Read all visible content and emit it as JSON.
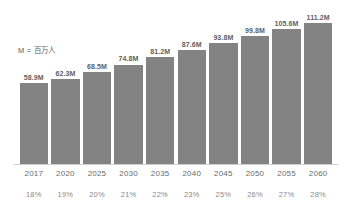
{
  "chart_data": {
    "type": "bar",
    "title": "",
    "subtitle": "",
    "xlabel": "",
    "ylabel": "",
    "grid": false,
    "legend_position": "inside-top-left",
    "annotations": [
      "M = 百万人"
    ],
    "categories": [
      "2017",
      "2020",
      "2025",
      "2030",
      "2035",
      "2040",
      "2045",
      "2050",
      "2055",
      "2060"
    ],
    "values": [
      58.9,
      62.3,
      68.5,
      74.8,
      81.2,
      87.6,
      93.8,
      99.8,
      105.6,
      111.2
    ],
    "value_labels": [
      "58.9M",
      "62.3M",
      "68.5M",
      "74.8M",
      "81.2M",
      "87.6M",
      "93.8M",
      "99.8M",
      "105.6M",
      "111.2M"
    ],
    "secondary_labels": [
      "18%",
      "19%",
      "20%",
      "21%",
      "22%",
      "23%",
      "25%",
      "26%",
      "27%",
      "28%"
    ],
    "secondary_values": [
      18,
      19,
      20,
      21,
      22,
      23,
      25,
      26,
      27,
      28
    ],
    "ylim": [
      0,
      120
    ],
    "bar_color": "#838383",
    "axis_color": "#cfcfcf",
    "text_color": "#6a6a6a"
  },
  "legend": {
    "note": "M = 百万人"
  }
}
